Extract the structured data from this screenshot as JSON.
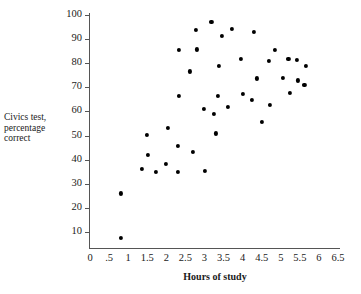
{
  "figure": {
    "caption_fragment": ""
  },
  "chart_data": {
    "type": "scatter",
    "title": "",
    "xlabel": "Hours of study",
    "ylabel": "Civics test, percentage correct",
    "ylabel_lines": [
      "Civics test,",
      "percentage",
      "correct"
    ],
    "xlim": [
      0,
      6.5
    ],
    "ylim": [
      0,
      103
    ],
    "grid": false,
    "legend": null,
    "marker": {
      "shape": "circle",
      "color": "#000000",
      "size_px": 4.2
    },
    "xticks": [
      0,
      0.5,
      1,
      1.5,
      2,
      2.5,
      3,
      3.5,
      4,
      4.5,
      5,
      5.5,
      6,
      6.5
    ],
    "xticklabels": [
      "0",
      ".5",
      "1",
      "1.5",
      "2",
      "2.5",
      "3",
      "3.5",
      "4",
      "4.5",
      "5",
      "5.5",
      "6",
      "6.5"
    ],
    "yticks": [
      10,
      20,
      30,
      40,
      50,
      60,
      70,
      80,
      90,
      100
    ],
    "yticklabels": [
      "10",
      "20",
      "30",
      "40",
      "50",
      "60",
      "70",
      "80",
      "90",
      "100"
    ],
    "n_points": 42,
    "points": [
      {
        "x": 0.82,
        "y": 7.5
      },
      {
        "x": 0.8,
        "y": 26.0
      },
      {
        "x": 1.35,
        "y": 36.0
      },
      {
        "x": 1.5,
        "y": 50.3
      },
      {
        "x": 1.52,
        "y": 42.0
      },
      {
        "x": 1.72,
        "y": 34.8
      },
      {
        "x": 2.0,
        "y": 38.3
      },
      {
        "x": 2.05,
        "y": 53.2
      },
      {
        "x": 2.3,
        "y": 34.8
      },
      {
        "x": 2.3,
        "y": 45.8
      },
      {
        "x": 2.33,
        "y": 66.3
      },
      {
        "x": 2.33,
        "y": 85.5
      },
      {
        "x": 2.62,
        "y": 76.6
      },
      {
        "x": 2.7,
        "y": 43.1
      },
      {
        "x": 2.78,
        "y": 93.8
      },
      {
        "x": 2.8,
        "y": 85.7
      },
      {
        "x": 2.98,
        "y": 61.0
      },
      {
        "x": 3.02,
        "y": 35.3
      },
      {
        "x": 3.18,
        "y": 97.0
      },
      {
        "x": 3.25,
        "y": 58.9
      },
      {
        "x": 3.3,
        "y": 50.9
      },
      {
        "x": 3.35,
        "y": 66.4
      },
      {
        "x": 3.38,
        "y": 79.0
      },
      {
        "x": 3.45,
        "y": 91.3
      },
      {
        "x": 3.62,
        "y": 62.0
      },
      {
        "x": 3.72,
        "y": 94.2
      },
      {
        "x": 3.95,
        "y": 81.9
      },
      {
        "x": 4.0,
        "y": 67.3
      },
      {
        "x": 4.25,
        "y": 64.7
      },
      {
        "x": 4.3,
        "y": 93.1
      },
      {
        "x": 4.38,
        "y": 73.7
      },
      {
        "x": 4.5,
        "y": 55.6
      },
      {
        "x": 4.68,
        "y": 80.8
      },
      {
        "x": 4.72,
        "y": 62.6
      },
      {
        "x": 4.85,
        "y": 85.4
      },
      {
        "x": 5.05,
        "y": 73.9
      },
      {
        "x": 5.2,
        "y": 81.8
      },
      {
        "x": 5.25,
        "y": 67.8
      },
      {
        "x": 5.42,
        "y": 81.3
      },
      {
        "x": 5.45,
        "y": 72.9
      },
      {
        "x": 5.65,
        "y": 79.0
      },
      {
        "x": 5.62,
        "y": 71.0
      }
    ]
  }
}
